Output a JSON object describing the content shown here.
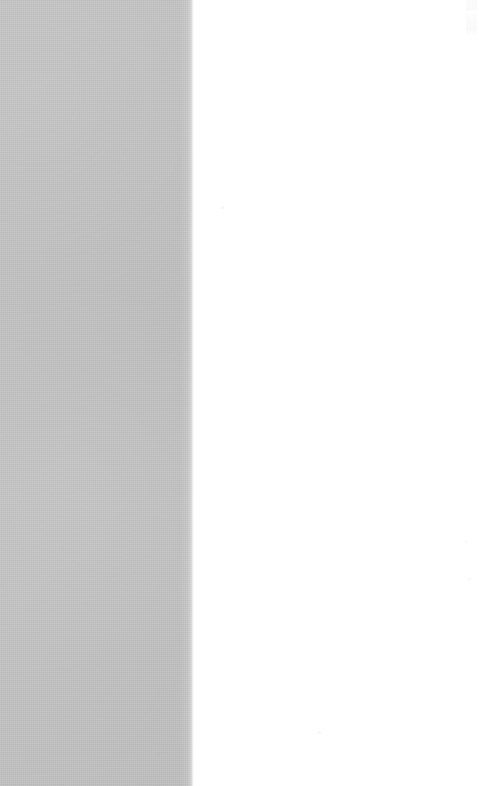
{
  "canvas": {
    "width": 479,
    "height": 786,
    "background_color": "#ffffff"
  },
  "regions": {
    "left_panel": {
      "name": "gray panel",
      "fill_color": "#c0c0c0",
      "x": 0,
      "y": 0,
      "width": 191,
      "height": 786,
      "texture": "fine paper grain",
      "content": ""
    },
    "boundary": {
      "name": "soft gradient edge",
      "x": 191,
      "width": 3,
      "from_color": "#c0c0c0",
      "to_color": "#ffffff"
    },
    "right_panel": {
      "name": "white panel",
      "fill_color": "#ffffff",
      "x": 194,
      "y": 0,
      "width": 285,
      "height": 786,
      "content": ""
    }
  },
  "artifacts": {
    "corner_smudge": {
      "name": "top-right faint smudge",
      "color": "#fafafa",
      "x": 468,
      "y": 0,
      "width": 11,
      "height": 36
    },
    "specks": [
      {
        "x": 221,
        "y": 206,
        "color": "#f6f6f6"
      },
      {
        "x": 318,
        "y": 731,
        "color": "#f6f6f6"
      },
      {
        "x": 468,
        "y": 578,
        "color": "#f6f6f6"
      },
      {
        "x": 465,
        "y": 540,
        "color": "#f6f6f6"
      }
    ]
  }
}
